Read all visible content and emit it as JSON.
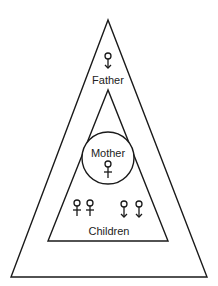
{
  "diagram": {
    "labels": {
      "father": "Father",
      "mother": "Mother",
      "children": "Children"
    },
    "symbols": {
      "father": "male-symbol",
      "mother": "female-symbol",
      "children": [
        "female-symbol",
        "female-symbol",
        "male-symbol",
        "male-symbol"
      ]
    },
    "line_color": "#1a1a1a"
  }
}
